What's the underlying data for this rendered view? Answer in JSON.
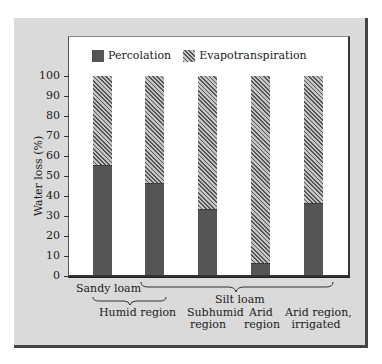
{
  "chart_data": {
    "type": "bar",
    "stacked": true,
    "title": "",
    "xlabel": "",
    "ylabel": "Water loss (%)",
    "ylim": [
      0,
      100
    ],
    "yticks": [
      0,
      10,
      20,
      30,
      40,
      50,
      60,
      70,
      80,
      90,
      100
    ],
    "grid": false,
    "legend_position": "top",
    "categories": [
      "Sandy loam, Humid region",
      "Silt loam, Humid region",
      "Silt loam, Subhumid region",
      "Silt loam, Arid region",
      "Silt loam, Arid region, irrigated"
    ],
    "series": [
      {
        "name": "Percolation",
        "pattern": "solid",
        "color": "#555555",
        "values": [
          55,
          46,
          33,
          6,
          36
        ]
      },
      {
        "name": "Evapotranspiration",
        "pattern": "hatched",
        "color": "#888888",
        "values": [
          45,
          54,
          67,
          94,
          64
        ]
      }
    ],
    "group_labels": {
      "soil": [
        "Sandy loam",
        "Silt loam"
      ],
      "region": [
        "Humid region",
        "Subhumid region",
        "Arid region",
        "Arid region, irrigated"
      ]
    }
  },
  "legend": {
    "percolation": "Percolation",
    "evapotranspiration": "Evapotranspiration"
  },
  "axis": {
    "ylabel": "Water loss (%)",
    "ticks": [
      "0",
      "10",
      "20",
      "30",
      "40",
      "50",
      "60",
      "70",
      "80",
      "90",
      "100"
    ]
  },
  "labels": {
    "sandy_loam": "Sandy loam",
    "silt_loam": "Silt loam",
    "humid": "Humid region",
    "subhumid_1": "Subhumid",
    "subhumid_2": "region",
    "arid_1": "Arid",
    "arid_2": "region",
    "irrigated_1": "Arid region,",
    "irrigated_2": "irrigated"
  }
}
